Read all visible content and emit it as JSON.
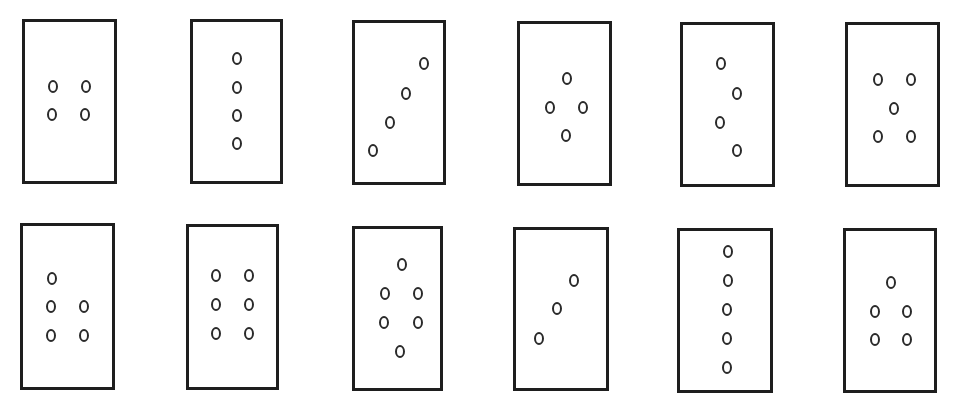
{
  "figure": {
    "colors": {
      "background": "#ffffff",
      "stroke": "#1e1e1e"
    },
    "cards": [
      {
        "id": 1,
        "row": 1,
        "col": 1,
        "count": 4,
        "pattern": "2x2 square",
        "box": [
          22,
          19,
          95,
          165
        ],
        "dots": [
          [
            53,
            86
          ],
          [
            86,
            86
          ],
          [
            52,
            114
          ],
          [
            85,
            114
          ]
        ]
      },
      {
        "id": 2,
        "row": 1,
        "col": 2,
        "count": 4,
        "pattern": "vertical line",
        "box": [
          190,
          19,
          93,
          165
        ],
        "dots": [
          [
            237,
            58
          ],
          [
            237,
            87
          ],
          [
            237,
            115
          ],
          [
            237,
            143
          ]
        ]
      },
      {
        "id": 3,
        "row": 1,
        "col": 3,
        "count": 4,
        "pattern": "diagonal line",
        "box": [
          352,
          20,
          94,
          165
        ],
        "dots": [
          [
            424,
            63
          ],
          [
            406,
            93
          ],
          [
            390,
            122
          ],
          [
            373,
            150
          ]
        ]
      },
      {
        "id": 4,
        "row": 1,
        "col": 4,
        "count": 4,
        "pattern": "diamond",
        "box": [
          517,
          21,
          95,
          165
        ],
        "dots": [
          [
            567,
            78
          ],
          [
            550,
            107
          ],
          [
            583,
            107
          ],
          [
            566,
            135
          ]
        ]
      },
      {
        "id": 5,
        "row": 1,
        "col": 5,
        "count": 4,
        "pattern": "zigzag",
        "box": [
          680,
          22,
          95,
          165
        ],
        "dots": [
          [
            721,
            63
          ],
          [
            737,
            93
          ],
          [
            720,
            122
          ],
          [
            737,
            150
          ]
        ]
      },
      {
        "id": 6,
        "row": 1,
        "col": 6,
        "count": 5,
        "pattern": "quincunx",
        "box": [
          845,
          22,
          95,
          165
        ],
        "dots": [
          [
            878,
            79
          ],
          [
            911,
            79
          ],
          [
            894,
            108
          ],
          [
            878,
            136
          ],
          [
            911,
            136
          ]
        ]
      },
      {
        "id": 7,
        "row": 2,
        "col": 1,
        "count": 5,
        "pattern": "1 over 2x2",
        "box": [
          20,
          223,
          95,
          167
        ],
        "dots": [
          [
            52,
            278
          ],
          [
            51,
            306
          ],
          [
            84,
            306
          ],
          [
            51,
            335
          ],
          [
            84,
            335
          ]
        ]
      },
      {
        "id": 8,
        "row": 2,
        "col": 2,
        "count": 6,
        "pattern": "2x3 grid",
        "box": [
          186,
          224,
          93,
          166
        ],
        "dots": [
          [
            216,
            275
          ],
          [
            249,
            275
          ],
          [
            216,
            304
          ],
          [
            249,
            304
          ],
          [
            216,
            333
          ],
          [
            249,
            333
          ]
        ]
      },
      {
        "id": 9,
        "row": 2,
        "col": 3,
        "count": 6,
        "pattern": "hexagon",
        "box": [
          352,
          226,
          91,
          165
        ],
        "dots": [
          [
            402,
            264
          ],
          [
            385,
            293
          ],
          [
            418,
            293
          ],
          [
            384,
            322
          ],
          [
            418,
            322
          ],
          [
            400,
            351
          ]
        ]
      },
      {
        "id": 10,
        "row": 2,
        "col": 4,
        "count": 3,
        "pattern": "diagonal line",
        "box": [
          513,
          227,
          96,
          164
        ],
        "dots": [
          [
            574,
            280
          ],
          [
            557,
            308
          ],
          [
            539,
            338
          ]
        ]
      },
      {
        "id": 11,
        "row": 2,
        "col": 5,
        "count": 5,
        "pattern": "vertical line",
        "box": [
          677,
          228,
          96,
          165
        ],
        "dots": [
          [
            728,
            251
          ],
          [
            728,
            280
          ],
          [
            727,
            309
          ],
          [
            727,
            338
          ],
          [
            727,
            367
          ]
        ]
      },
      {
        "id": 12,
        "row": 2,
        "col": 6,
        "count": 5,
        "pattern": "1 over 2x2",
        "box": [
          843,
          228,
          94,
          165
        ],
        "dots": [
          [
            891,
            282
          ],
          [
            875,
            311
          ],
          [
            907,
            311
          ],
          [
            875,
            339
          ],
          [
            907,
            339
          ]
        ]
      }
    ]
  }
}
